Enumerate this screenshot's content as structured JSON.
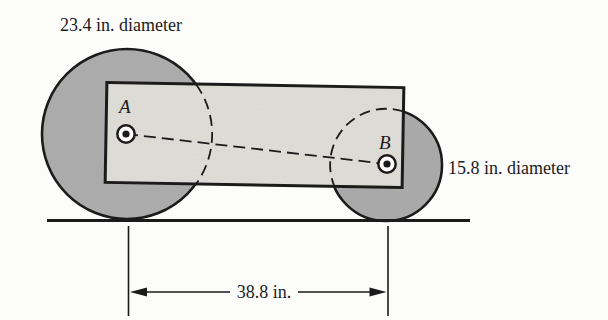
{
  "figure": {
    "labels": {
      "left_wheel_diameter": "23.4 in. diameter",
      "right_wheel_diameter": "15.8 in. diameter",
      "wheelbase": "38.8 in.",
      "point_a": "A",
      "point_b": "B"
    },
    "measurements": {
      "left_wheel_diameter_in": 23.4,
      "right_wheel_diameter_in": 15.8,
      "wheelbase_in": 38.8
    },
    "colors": {
      "background": "#fcfcfb",
      "wheel_fill": "#ababab",
      "body_fill": "#dedcd7",
      "ink": "#1b1b1b",
      "marker_ring_fill": "#ffffff"
    }
  }
}
